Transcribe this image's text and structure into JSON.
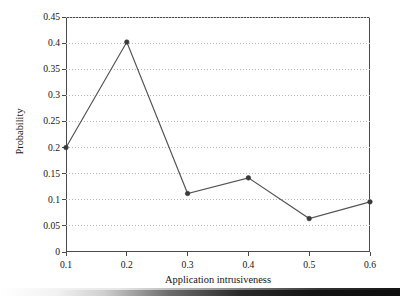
{
  "chart_data": {
    "type": "line",
    "title": "",
    "xlabel": "Application intrusiveness",
    "ylabel": "Probability",
    "x": [
      0.1,
      0.2,
      0.3,
      0.4,
      0.5,
      0.6
    ],
    "values": [
      0.2,
      0.402,
      0.112,
      0.142,
      0.064,
      0.096
    ],
    "series": [
      {
        "name": "Probability",
        "x": [
          0.1,
          0.2,
          0.3,
          0.4,
          0.5,
          0.6
        ],
        "values": [
          0.2,
          0.402,
          0.112,
          0.142,
          0.064,
          0.096
        ]
      }
    ],
    "xlim": [
      0.1,
      0.6
    ],
    "ylim": [
      0,
      0.45
    ],
    "xticks": [
      0.1,
      0.2,
      0.3,
      0.4,
      0.5,
      0.6
    ],
    "xtick_labels": [
      "0.1",
      "0.2",
      "0.3",
      "0.4",
      "0.5",
      "0.6"
    ],
    "yticks": [
      0,
      0.05,
      0.1,
      0.15,
      0.2,
      0.25,
      0.3,
      0.35,
      0.4,
      0.45
    ],
    "ytick_labels": [
      "0",
      "0.05",
      "0.1",
      "0.15",
      "0.2",
      "0.25",
      "0.3",
      "0.35",
      "0.4",
      "0.45"
    ],
    "grid": {
      "horizontal": true,
      "vertical": false,
      "style": "dotted",
      "color": "#b8b8b8"
    },
    "legend": {
      "visible": false,
      "position": "none",
      "entries": []
    },
    "marker": "circle",
    "colors": {
      "line": "#555555",
      "marker": "#3a3a3a",
      "axis": "#4a4a4a",
      "grid": "#b8b8b8",
      "text": "#161616",
      "background": "#ffffff"
    },
    "annotations": []
  }
}
